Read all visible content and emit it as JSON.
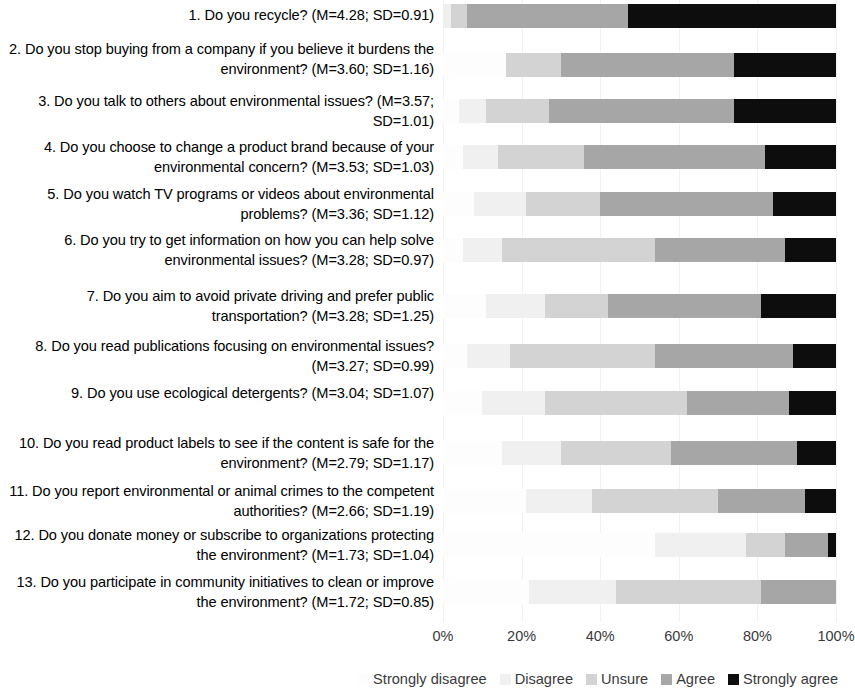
{
  "chart_data": {
    "type": "bar",
    "orientation": "horizontal",
    "stacked": true,
    "normalized_percent": true,
    "title": "",
    "subtitle": "",
    "xlabel": "",
    "ylabel": "",
    "xlim": [
      0,
      100
    ],
    "x_ticks": [
      "0%",
      "20%",
      "40%",
      "60%",
      "80%",
      "100%"
    ],
    "x_tick_values": [
      0,
      20,
      40,
      60,
      80,
      100
    ],
    "grid": true,
    "legend_position": "bottom-right",
    "legend": [
      {
        "name": "Strongly disagree",
        "color": "#fdfdfd"
      },
      {
        "name": "Disagree",
        "color": "#f0f0f0"
      },
      {
        "name": "Unsure",
        "color": "#d3d3d3"
      },
      {
        "name": "Agree",
        "color": "#a6a6a6"
      },
      {
        "name": "Strongly agree",
        "color": "#0d0d0d"
      }
    ],
    "series": [
      {
        "name": "Strongly disagree",
        "values": [
          0,
          16,
          4,
          5,
          8,
          5,
          11,
          6,
          10,
          15,
          21,
          54,
          22
        ]
      },
      {
        "name": "Disagree",
        "values": [
          2,
          0,
          7,
          9,
          13,
          10,
          15,
          11,
          16,
          15,
          17,
          23,
          22
        ]
      },
      {
        "name": "Unsure",
        "values": [
          4,
          14,
          16,
          22,
          19,
          39,
          16,
          37,
          36,
          28,
          32,
          10,
          37
        ]
      },
      {
        "name": "Agree",
        "values": [
          41,
          44,
          47,
          46,
          44,
          33,
          39,
          35,
          26,
          32,
          22,
          11,
          19
        ]
      },
      {
        "name": "Strongly agree",
        "values": [
          53,
          26,
          26,
          18,
          16,
          13,
          19,
          11,
          12,
          10,
          8,
          2,
          0
        ]
      }
    ],
    "categories": [
      "1. Do you recycle? (M=4.28; SD=0.91)",
      "2. Do you stop buying from a company if you believe it burdens the environment? (M=3.60; SD=1.16)",
      "3. Do you talk to others about environmental issues? (M=3.57; SD=1.01)",
      "4. Do you choose to change a product brand because of your environmental concern? (M=3.53; SD=1.03)",
      "5. Do you watch TV programs or videos about environmental problems? (M=3.36; SD=1.12)",
      "6. Do you try to get information on how you can help solve environmental issues? (M=3.28; SD=0.97)",
      "7. Do you aim to avoid private driving and prefer public transportation? (M=3.28; SD=1.25)",
      "8. Do you read publications focusing on environmental issues? (M=3.27; SD=0.99)",
      "9. Do you use ecological detergents? (M=3.04; SD=1.07)",
      "10. Do you read product labels to see if the content is safe for the environment? (M=2.79; SD=1.17)",
      "11. Do you report environmental or animal crimes to the competent authorities? (M=2.66; SD=1.19)",
      "12. Do you donate money or subscribe to organizations protecting the environment? (M=1.73; SD=1.04)",
      "13. Do you participate in community initiatives to clean or improve the environment? (M=1.72; SD=0.85)"
    ]
  },
  "rows": [
    {
      "label": "1. Do you recycle? (M=4.28; SD=0.91)",
      "question_number": "1",
      "mean": "4.28",
      "sd": "0.91",
      "top": 4,
      "label_top": 6,
      "height": 24,
      "segments": [
        0,
        2,
        4,
        41,
        53
      ]
    },
    {
      "label": "2. Do you stop buying from a company if you believe it burdens the environment? (M=3.60; SD=1.16)",
      "question_number": "2",
      "mean": "3.60",
      "sd": "1.16",
      "top": 53,
      "label_top": 40,
      "height": 24,
      "segments": [
        16,
        0,
        14,
        44,
        26
      ]
    },
    {
      "label": "3. Do you talk to others about environmental issues? (M=3.57; SD=1.01)",
      "question_number": "3",
      "mean": "3.57",
      "sd": "1.01",
      "top": 99,
      "label_top": 92,
      "height": 24,
      "segments": [
        4,
        7,
        16,
        47,
        26
      ]
    },
    {
      "label": "4. Do you choose to change a product brand because of your environmental concern? (M=3.53; SD=1.03)",
      "question_number": "4",
      "mean": "3.53",
      "sd": "1.03",
      "top": 145,
      "label_top": 138,
      "height": 24,
      "segments": [
        5,
        9,
        22,
        46,
        18
      ]
    },
    {
      "label": "5. Do you watch TV programs or videos about environmental problems? (M=3.36; SD=1.12)",
      "question_number": "5",
      "mean": "3.36",
      "sd": "1.12",
      "top": 192,
      "label_top": 185,
      "height": 24,
      "segments": [
        8,
        13,
        19,
        44,
        16
      ]
    },
    {
      "label": "6. Do you try to get information on how you can help solve environmental issues? (M=3.28; SD=0.97)",
      "question_number": "6",
      "mean": "3.28",
      "sd": "0.97",
      "top": 238,
      "label_top": 231,
      "height": 24,
      "segments": [
        5,
        10,
        39,
        33,
        13
      ]
    },
    {
      "label": "7. Do you aim to avoid private driving and prefer public transportation? (M=3.28; SD=1.25)",
      "question_number": "7",
      "mean": "3.28",
      "sd": "1.25",
      "top": 294,
      "label_top": 287,
      "height": 24,
      "segments": [
        11,
        15,
        16,
        39,
        19
      ]
    },
    {
      "label": "8. Do you read publications focusing on environmental issues? (M=3.27; SD=0.99)",
      "question_number": "8",
      "mean": "3.27",
      "sd": "0.99",
      "top": 344,
      "label_top": 337,
      "height": 24,
      "segments": [
        6,
        11,
        37,
        35,
        11
      ]
    },
    {
      "label": "9. Do you use ecological detergents? (M=3.04; SD=1.07)",
      "question_number": "9",
      "mean": "3.04",
      "sd": "1.07",
      "top": 391,
      "label_top": 384,
      "height": 24,
      "segments": [
        10,
        16,
        36,
        26,
        12
      ]
    },
    {
      "label": "10. Do you read product labels to see if the content is safe for the environment? (M=2.79; SD=1.17)",
      "question_number": "10",
      "mean": "2.79",
      "sd": "1.17",
      "top": 441,
      "label_top": 434,
      "height": 24,
      "segments": [
        15,
        15,
        28,
        32,
        10
      ]
    },
    {
      "label": "11. Do you report environmental or animal crimes to the competent authorities? (M=2.66; SD=1.19)",
      "question_number": "11",
      "mean": "2.66",
      "sd": "1.19",
      "top": 489,
      "label_top": 482,
      "height": 24,
      "segments": [
        21,
        17,
        32,
        22,
        8
      ]
    },
    {
      "label": "12. Do you donate money or subscribe to organizations protecting the environment? (M=1.73; SD=1.04)",
      "question_number": "12",
      "mean": "1.73",
      "sd": "1.04",
      "top": 533,
      "label_top": 526,
      "height": 24,
      "segments": [
        54,
        23,
        10,
        11,
        2
      ]
    },
    {
      "label": "13. Do you participate in community initiatives to clean or improve the environment? (M=1.72; SD=0.85)",
      "question_number": "13",
      "mean": "1.72",
      "sd": "0.85",
      "top": 580,
      "label_top": 573,
      "height": 24,
      "segments": [
        22,
        22,
        37,
        19,
        0
      ]
    }
  ],
  "x_axis": {
    "ticks": [
      {
        "label": "0%",
        "value": 0
      },
      {
        "label": "20%",
        "value": 20
      },
      {
        "label": "40%",
        "value": 40
      },
      {
        "label": "60%",
        "value": 60
      },
      {
        "label": "80%",
        "value": 80
      },
      {
        "label": "100%",
        "value": 100
      }
    ]
  },
  "legend": {
    "items": [
      {
        "label": "Strongly disagree",
        "color": "#fdfdfd"
      },
      {
        "label": "Disagree",
        "color": "#f0f0f0"
      },
      {
        "label": "Unsure",
        "color": "#d3d3d3"
      },
      {
        "label": "Agree",
        "color": "#a6a6a6"
      },
      {
        "label": "Strongly agree",
        "color": "#0d0d0d"
      }
    ]
  }
}
